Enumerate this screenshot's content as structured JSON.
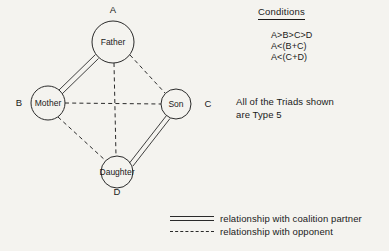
{
  "figure": {
    "background_color": "#f4f3ef",
    "ink_color": "#2a2a2a"
  },
  "diagram": {
    "nodes": [
      {
        "id": "A",
        "label": "Father",
        "corner_label": "A",
        "cx": 113,
        "cy": 42,
        "r": 21,
        "corner_x": 113,
        "corner_y": 10
      },
      {
        "id": "B",
        "label": "Mother",
        "corner_label": "B",
        "cx": 48,
        "cy": 103,
        "r": 17,
        "corner_x": 19,
        "corner_y": 103
      },
      {
        "id": "C",
        "label": "Son",
        "corner_label": "C",
        "cx": 176,
        "cy": 104,
        "r": 15,
        "corner_x": 208,
        "corner_y": 104
      },
      {
        "id": "D",
        "label": "Daughter",
        "corner_label": "D",
        "cx": 117,
        "cy": 172,
        "r": 16,
        "corner_x": 117,
        "corner_y": 192
      }
    ],
    "edges": [
      {
        "from": "A",
        "to": "B",
        "type": "coalition",
        "style": "double-solid"
      },
      {
        "from": "C",
        "to": "D",
        "type": "coalition",
        "style": "double-solid"
      },
      {
        "from": "A",
        "to": "C",
        "type": "opponent",
        "style": "dashed"
      },
      {
        "from": "A",
        "to": "D",
        "type": "opponent",
        "style": "dashed"
      },
      {
        "from": "B",
        "to": "C",
        "type": "opponent",
        "style": "dashed"
      },
      {
        "from": "B",
        "to": "D",
        "type": "opponent",
        "style": "dashed"
      }
    ]
  },
  "conditions": {
    "heading": "Conditions",
    "lines": [
      "A>B>C>D",
      "A<(B+C)",
      "A<(C+D)"
    ]
  },
  "note": {
    "line1": "All of the Triads shown",
    "line2": "are Type 5"
  },
  "legend": {
    "items": [
      {
        "sample": "double-solid-line",
        "label": "relationship with coalition partner"
      },
      {
        "sample": "dashed-line",
        "label": "relationship with opponent"
      }
    ]
  }
}
